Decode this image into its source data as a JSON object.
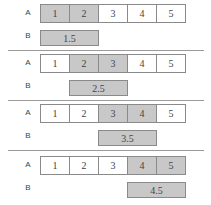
{
  "labels": {
    "a": "A",
    "b": "B"
  },
  "panels": [
    {
      "cells": [
        "1",
        "2",
        "3",
        "4",
        "5"
      ],
      "highlight": [
        0,
        1
      ],
      "b_value": "1.5"
    },
    {
      "cells": [
        "1",
        "2",
        "3",
        "4",
        "5"
      ],
      "highlight": [
        1,
        2
      ],
      "b_value": "2.5"
    },
    {
      "cells": [
        "1",
        "2",
        "3",
        "4",
        "5"
      ],
      "highlight": [
        2,
        3
      ],
      "b_value": "3.5"
    },
    {
      "cells": [
        "1",
        "2",
        "3",
        "4",
        "5"
      ],
      "highlight": [
        3,
        4
      ],
      "b_value": "4.5"
    }
  ],
  "colors": {
    "highlight": "#c8c8c8",
    "border": "#8a8a8a",
    "divider": "#9a9a9a"
  }
}
